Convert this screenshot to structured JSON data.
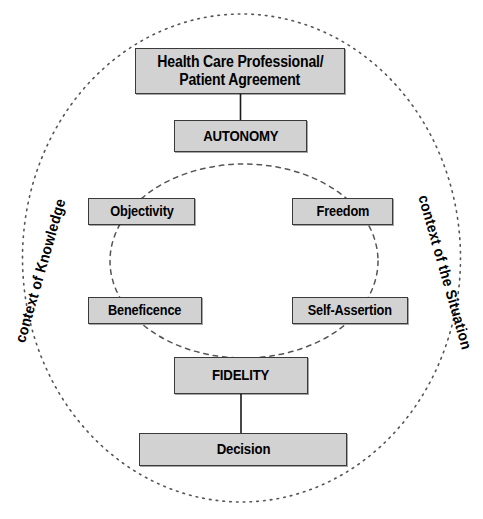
{
  "diagram": {
    "colors": {
      "box_fill": "#d2d2d2",
      "box_border": "#3a3a3a",
      "connector": "#1a1a1a",
      "ring": "#555555",
      "background": "#ffffff"
    },
    "nodes": [
      {
        "id": "agreement",
        "line1": "Health Care Professional/",
        "line2": "Patient Agreement"
      },
      {
        "id": "autonomy",
        "line1": "AUTONOMY"
      },
      {
        "id": "objectivity",
        "line1": "Objectivity"
      },
      {
        "id": "freedom",
        "line1": "Freedom"
      },
      {
        "id": "beneficence",
        "line1": "Beneficence"
      },
      {
        "id": "selfassertion",
        "line1": "Self-Assertion"
      },
      {
        "id": "fidelity",
        "line1": "FIDELITY"
      },
      {
        "id": "decision",
        "line1": "Decision"
      }
    ],
    "ring_labels": {
      "left": "context of Knowledge",
      "right": "context of the Situation"
    },
    "rings": [
      {
        "id": "outer-ring",
        "style": "dotted"
      },
      {
        "id": "inner-ring",
        "style": "dashed"
      }
    ]
  }
}
